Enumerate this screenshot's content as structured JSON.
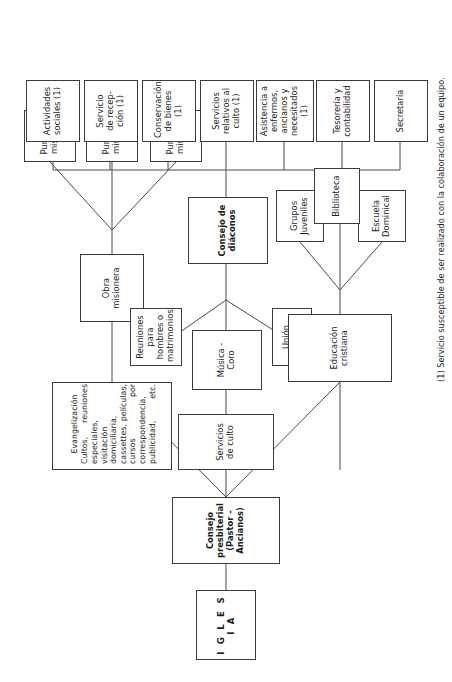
{
  "diagram": {
    "orientation": "rotated-90-ccw",
    "stroke_color": "#4a4a4a",
    "box_border_color": "#3b3b3b",
    "background": "#ffffff"
  },
  "nodes": {
    "iglesia": "I G L E S I A",
    "consejo_presbiterial": "Consejo presbiterial\n(Pastor - Ancianos)",
    "evangelizacion_title": "Evangelización",
    "evangelizacion_body": "Cultos, reuniones especiales, visitación domiciliaria, cassettes, películas, cursos por correspondencia, publicidad, etc.",
    "obra_misionera": "Obra misionera",
    "punto_mision_a": "Punto de\nmisión A",
    "punto_mision_b": "Punto de\nmisión B",
    "punto_mision_c": "Punto de\nmisión C",
    "servicios_de_culto": "Servicios de culto",
    "musica_coro": "Música - Coro",
    "reuniones_hombres": "Reuniones para\nhombres o\nmatrimonios",
    "union_femenina": "Unión Femenina",
    "educacion_cristiana": "Educación cristiana",
    "grupos_juveniles": "Grupos\nJuveniles",
    "escuela_dominical": "Escuela\nDominical",
    "biblioteca": "Biblioteca",
    "consejo_diaconos": "Consejo de diáconos",
    "actividades_sociales": "Actividades\nsociales (1)",
    "servicio_recepcion": "Servicio\nde recep-\nción (1)",
    "conservacion_bienes": "Conservación\nde bienes (1)",
    "servicios_culto_1": "Servicios\nrelativos al\nculto (1)",
    "asistencia_enfermos": "Asistencia a\nenfermos,\nancianos y\nnecesitados\n(1)",
    "tesoreria": "Tesorería y\ncontabilidad",
    "secretaria": "Secretaría"
  },
  "footnote": {
    "marker": "(1)",
    "text": "(1)   Servicio susceptible de ser realizado con la colaboración de un equipo."
  }
}
